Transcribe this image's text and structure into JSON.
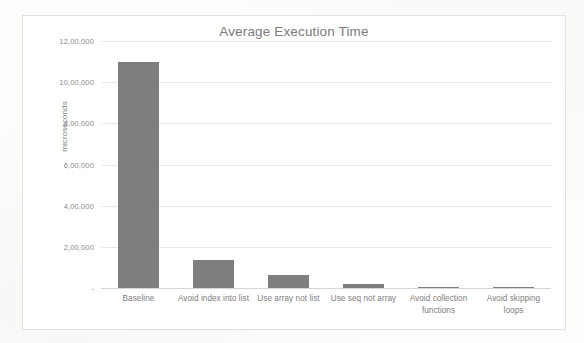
{
  "chart_data": {
    "type": "bar",
    "title": "Average Execution Time",
    "xlabel": "",
    "ylabel": "microseconds",
    "categories": [
      "Baseline",
      "Avoid index into list",
      "Use array not list",
      "Use seq not array",
      "Avoid collection functions",
      "Avoid skipping loops"
    ],
    "values": [
      1100000,
      135000,
      65000,
      18000,
      3000,
      2500
    ],
    "ylim": [
      0,
      1200000
    ],
    "ytick_values": [
      0,
      200000,
      400000,
      600000,
      800000,
      1000000,
      1200000
    ],
    "ytick_labels": [
      "-",
      "2,00,000",
      "4,00,000",
      "6,00,000",
      "8,00,000",
      "10,00,000",
      "12,00,000"
    ],
    "grid": true,
    "legend": false,
    "bar_color": "#7e7e7e",
    "gridline_color": "#e8e8e8",
    "title_color": "#7b7b7b",
    "label_color": "#7d7d7d"
  }
}
